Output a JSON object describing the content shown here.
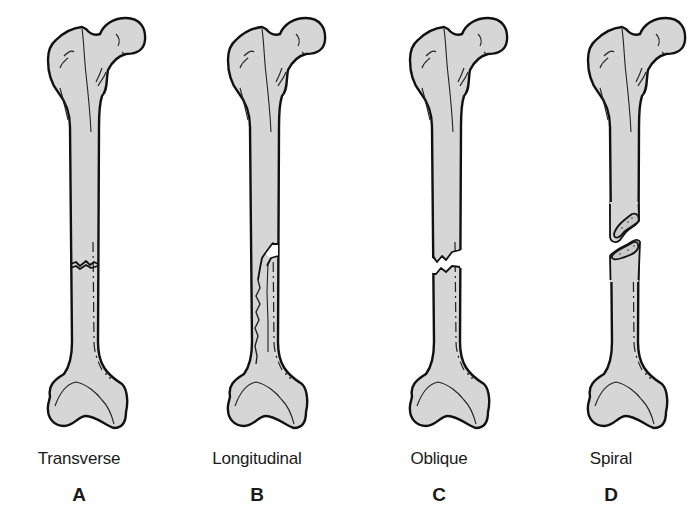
{
  "figure": {
    "type": "femur fracture types illustration",
    "panels": [
      {
        "id": "A",
        "letter": "A",
        "caption": "Transverse"
      },
      {
        "id": "B",
        "letter": "B",
        "caption": "Longitudinal"
      },
      {
        "id": "C",
        "letter": "C",
        "caption": "Oblique"
      },
      {
        "id": "D",
        "letter": "D",
        "caption": "Spiral"
      }
    ]
  },
  "colors": {
    "bone_fill": "#d6d6d6",
    "outline": "#111111",
    "background": "#ffffff"
  }
}
